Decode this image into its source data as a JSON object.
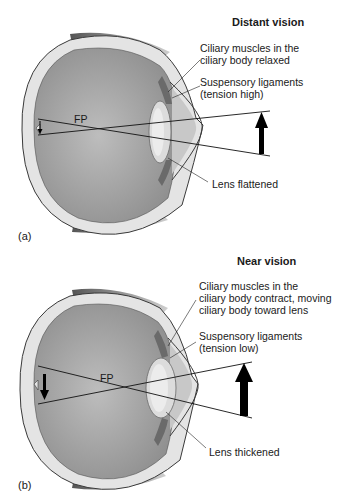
{
  "figure": {
    "panels": [
      {
        "id": "a",
        "part_label": "(a)",
        "title": "Distant vision",
        "labels": {
          "ciliary_line1": "Ciliary muscles in the",
          "ciliary_line2": "ciliary body relaxed",
          "suspensory_line1": "Suspensory ligaments",
          "suspensory_line2": "(tension high)",
          "lens": "Lens flattened",
          "focal_point": "FP"
        }
      },
      {
        "id": "b",
        "part_label": "(b)",
        "title": "Near vision",
        "labels": {
          "ciliary_line1": "Ciliary muscles in the",
          "ciliary_line2": "ciliary body contract, moving",
          "ciliary_line3": "ciliary body toward lens",
          "suspensory_line1": "Suspensory ligaments",
          "suspensory_line2": "(tension low)",
          "lens": "Lens thickened",
          "focal_point": "FP"
        }
      }
    ],
    "colors": {
      "eye_interior": "#a9a9a9",
      "sclera": "#e4e4e4",
      "outline": "#3a3a3a",
      "lens": "#dcdcdc",
      "ray": "#111111",
      "arrow": "#000000"
    }
  }
}
